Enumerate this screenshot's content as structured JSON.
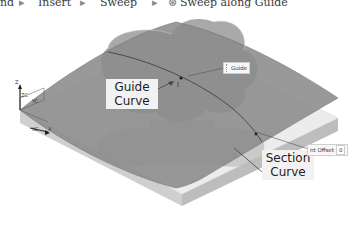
{
  "breadcrumb": {
    "items": [
      {
        "label": "nd"
      },
      {
        "label": "Insert"
      },
      {
        "label": "Sweep"
      },
      {
        "label": "Sweep along Guide",
        "icon": "sweep-icon"
      }
    ],
    "separator": "▸"
  },
  "viewport": {
    "callouts": {
      "guide_curve": {
        "line1": "Guide",
        "line2": "Curve"
      },
      "section_curve": {
        "line1": "Section",
        "line2": "Curve"
      }
    },
    "dynamic_inputs": {
      "guide": {
        "label": "Guide"
      },
      "offset": {
        "label": "nt Offset",
        "value": "0"
      }
    },
    "triad": {
      "z_label": "Z",
      "zc_label": "ZC",
      "yc_label": "YC",
      "xc_label": "XC",
      "x_label": "X"
    },
    "colors": {
      "surface": "#8a8a8a",
      "block_top": "#e6e6e6",
      "block_side": "#c8c8c8",
      "section_shape": "#9c9c9c",
      "background": "#ffffff"
    }
  }
}
